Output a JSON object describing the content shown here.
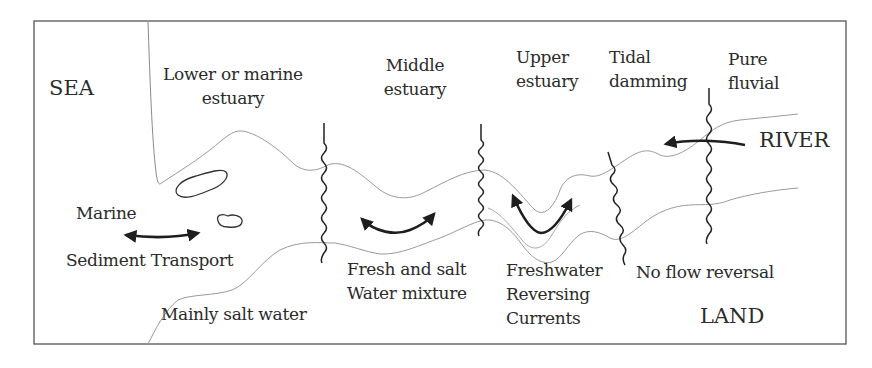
{
  "diagram": {
    "type": "estuary zonation schematic",
    "regions": {
      "sea": "SEA",
      "land": "LAND",
      "river": "RIVER"
    },
    "zones": [
      {
        "id": "lower",
        "line1": "Lower or marine",
        "line2": "estuary"
      },
      {
        "id": "middle",
        "line1": "Middle",
        "line2": "estuary"
      },
      {
        "id": "upper",
        "line1": "Upper",
        "line2": "estuary"
      },
      {
        "id": "tidal",
        "line1": "Tidal",
        "line2": "damming"
      },
      {
        "id": "fluvial",
        "line1": "Pure",
        "line2": "fluvial"
      }
    ],
    "annotations": {
      "marine": "Marine",
      "sediment_transport": "Sediment Transport",
      "mainly_salt": "Mainly salt water",
      "mixture_line1": "Fresh and salt",
      "mixture_line2": "Water mixture",
      "freshwater_line1": "Freshwater",
      "freshwater_line2": "Reversing",
      "freshwater_line3": "Currents",
      "no_reversal": "No flow reversal"
    },
    "colors": {
      "frame": "#555555",
      "channel": "#9a9a9a",
      "boundary": "#222222",
      "arrow": "#1e1e1e",
      "text": "#2b2b2b"
    }
  }
}
